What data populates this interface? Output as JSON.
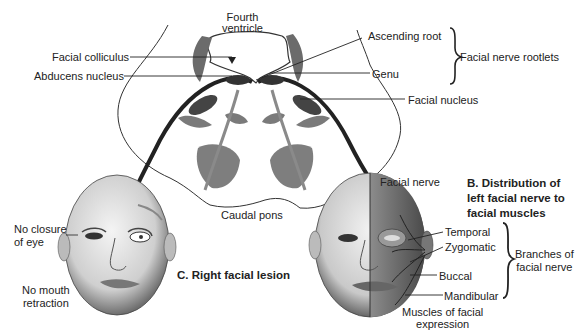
{
  "pons": {
    "ventricle_label": [
      "Fourth",
      "ventricle"
    ],
    "title": "Caudal pons",
    "left_labels": {
      "facial_colliculus": "Facial colliculus",
      "abducens_nucleus": "Abducens nucleus"
    },
    "right_labels": {
      "ascending_root": "Ascending root",
      "genu": "Genu",
      "facial_nucleus": "Facial nucleus",
      "facial_nerve": "Facial nerve"
    },
    "rootlets_group": "Facial nerve rootlets"
  },
  "panel_c": {
    "title": "C. Right facial lesion",
    "labels": {
      "eye": [
        "No closure",
        "of eye"
      ],
      "mouth": [
        "No mouth",
        "retraction"
      ]
    }
  },
  "panel_b": {
    "title": [
      "B. Distribution of",
      "left facial nerve to",
      "facial muscles"
    ],
    "branches": [
      "Temporal",
      "Zygomatic",
      "Buccal",
      "Mandibular"
    ],
    "branches_group": [
      "Branches of",
      "facial nerve"
    ],
    "muscles_label": [
      "Muscles of facial",
      "expression"
    ]
  },
  "colors": {
    "ink": "#222222",
    "nerve": "#2a2a2a",
    "nucleus": "#555555",
    "gray_structure": "#7a7a7a",
    "skin_light": "#e6e6e6",
    "skin_dark": "#8a8a8a"
  }
}
